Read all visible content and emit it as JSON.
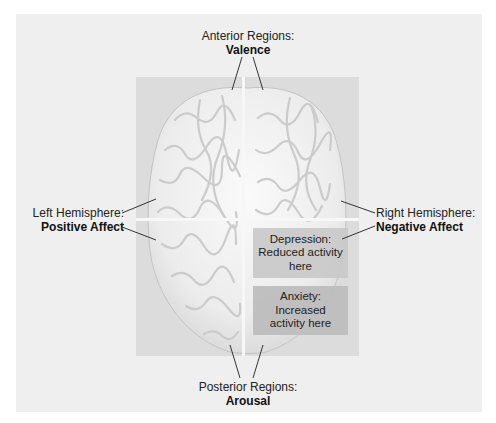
{
  "figure": {
    "anterior": {
      "title": "Anterior Regions:",
      "emphasis": "Valence"
    },
    "posterior": {
      "title": "Posterior Regions:",
      "emphasis": "Arousal"
    },
    "left": {
      "title": "Left Hemisphere:",
      "emphasis": "Positive Affect"
    },
    "right": {
      "title": "Right Hemisphere:",
      "emphasis": "Negative Affect"
    },
    "depression_box": {
      "line1": "Depression:",
      "line2": "Reduced activity",
      "line3": "here"
    },
    "anxiety_box": {
      "line1": "Anxiety:",
      "line2": "Increased",
      "line3": "activity here"
    }
  },
  "colors": {
    "frame_bg": "#efefef",
    "panel_bg": "#dcdcdc",
    "brain_fill": "#f2f2f2",
    "depression_box": "#c9c9c9",
    "anxiety_box": "#bdbdbd",
    "divider": "#f7f7f7",
    "leader_line": "#333333"
  }
}
